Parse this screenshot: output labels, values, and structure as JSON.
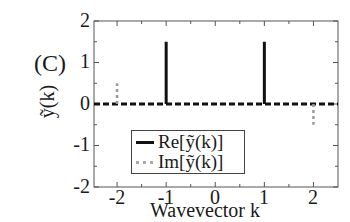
{
  "chart_data": {
    "type": "line",
    "title": "",
    "panel_label": "(C)",
    "xlabel": "Wavevector k",
    "ylabel": "ỹ(k)",
    "xlim": [
      -2.47,
      2.5
    ],
    "ylim": [
      -2,
      2
    ],
    "xticks": [
      "-2",
      "-1",
      "0",
      "1",
      "2"
    ],
    "yticks": [
      "2",
      "1",
      "0",
      "-1",
      "-2"
    ],
    "grid": false,
    "legend_position": "lower-left-center",
    "series": [
      {
        "name": "Re[ỹ(k)]",
        "style": "solid-black",
        "color": "#111111",
        "points": [
          {
            "k": -1,
            "value": 1.5
          },
          {
            "k": 1,
            "value": 1.5
          }
        ],
        "baseline": 0
      },
      {
        "name": "Im[ỹ(k)]",
        "style": "dotted-gray",
        "color": "#999999",
        "points": [
          {
            "k": -2,
            "value": 0.5
          },
          {
            "k": 2,
            "value": -0.5
          }
        ],
        "baseline": 0
      }
    ]
  },
  "labels": {
    "panel": "(C)",
    "ylabel": "ỹ(k)",
    "xlabel": "Wavevector k",
    "legend_re": "Re[ỹ(k)]",
    "legend_im": "Im[ỹ(k)]",
    "ytick_2": "2",
    "ytick_1": "1",
    "ytick_0": "0",
    "ytick_m1": "-1",
    "ytick_m2": "-2",
    "xtick_m2": "-2",
    "xtick_m1": "-1",
    "xtick_0": "0",
    "xtick_1": "1",
    "xtick_2": "2"
  }
}
